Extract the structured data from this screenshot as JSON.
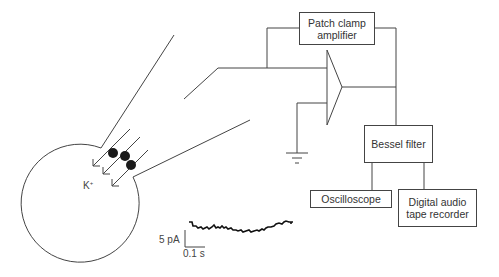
{
  "diagram": {
    "boxes": {
      "amplifier": "Patch clamp amplifier",
      "amplifier_line1": "Patch clamp",
      "amplifier_line2": "amplifier",
      "filter": "Bessel filter",
      "oscilloscope": "Oscilloscope",
      "recorder_line1": "Digital audio",
      "recorder_line2": "tape recorder"
    },
    "labels": {
      "ion": "K",
      "ion_charge": "+",
      "scale_current": "5 pA",
      "scale_time": "0.1 s"
    },
    "colors": {
      "line": "#444444",
      "channel": "#1a1a1a"
    }
  }
}
